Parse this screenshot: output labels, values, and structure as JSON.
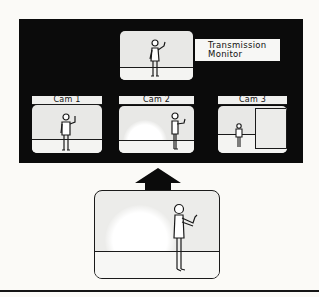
{
  "diagram": {
    "transmission_monitor": {
      "label_line1": "Transmission",
      "label_line2": "Monitor"
    },
    "cameras": [
      {
        "label": "Cam 1",
        "shot": "medium shot of presenter"
      },
      {
        "label": "Cam 2",
        "shot": "presenter right of frame"
      },
      {
        "label": "Cam 3",
        "shot": "wide shot with door/panel"
      }
    ],
    "arrow": {
      "direction": "up"
    },
    "source_scene": {
      "description": "presenter gesturing, studio floor"
    },
    "colors": {
      "panel": "#0b0b0b",
      "screen": "#e8e8e6",
      "ink": "#1a1a1a",
      "paper": "#fbfaf7"
    }
  }
}
